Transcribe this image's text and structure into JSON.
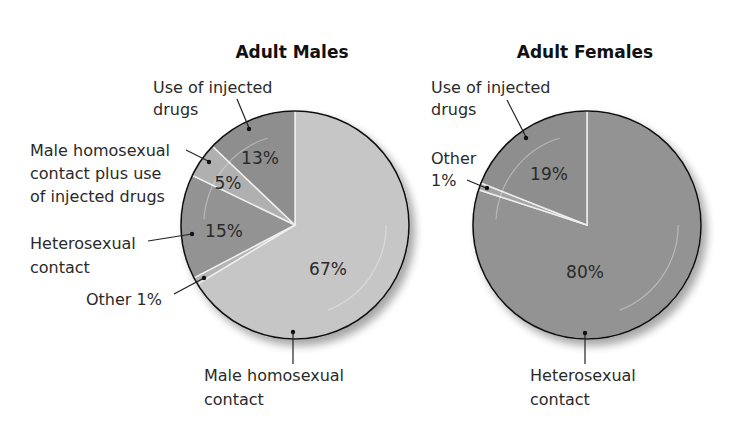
{
  "chart_data": [
    {
      "type": "pie",
      "title": "Adult Males",
      "slices": [
        {
          "label": "Male homosexual contact",
          "value": 67,
          "value_label": "67%",
          "color": "#c6c6c6"
        },
        {
          "label": "Other 1%",
          "value": 1,
          "value_label": "",
          "color": "#b4b4b4"
        },
        {
          "label": "Heterosexual contact",
          "value": 15,
          "value_label": "15%",
          "color": "#939393"
        },
        {
          "label": "Male homosexual contact plus use of injected drugs",
          "value": 5,
          "value_label": "5%",
          "color": "#b0b0b0"
        },
        {
          "label": "Use of injected drugs",
          "value": 13,
          "value_label": "13%",
          "color": "#8e8e8e"
        }
      ],
      "callouts": [
        {
          "lines": [
            "Use of injected drugs"
          ],
          "line1": "Use of injected",
          "line2": "drugs"
        },
        {
          "line1": "Male homosexual",
          "line2": "contact plus use",
          "line3": "of injected drugs"
        },
        {
          "line1": "Heterosexual",
          "line2": "contact"
        },
        {
          "line1": "Other 1%"
        },
        {
          "line1": "Male homosexual",
          "line2": "contact"
        }
      ]
    },
    {
      "type": "pie",
      "title": "Adult Females",
      "slices": [
        {
          "label": "Heterosexual contact",
          "value": 80,
          "value_label": "80%",
          "color": "#939393"
        },
        {
          "label": "Other 1%",
          "value": 1,
          "value_label": "",
          "color": "#a4a4a4"
        },
        {
          "label": "Use of injected drugs",
          "value": 19,
          "value_label": "19%",
          "color": "#8e8e8e"
        }
      ],
      "callouts": [
        {
          "line1": "Use of injected",
          "line2": "drugs"
        },
        {
          "line1": "Other",
          "line2": "1%"
        },
        {
          "line1": "Heterosexual",
          "line2": "contact"
        }
      ]
    }
  ]
}
